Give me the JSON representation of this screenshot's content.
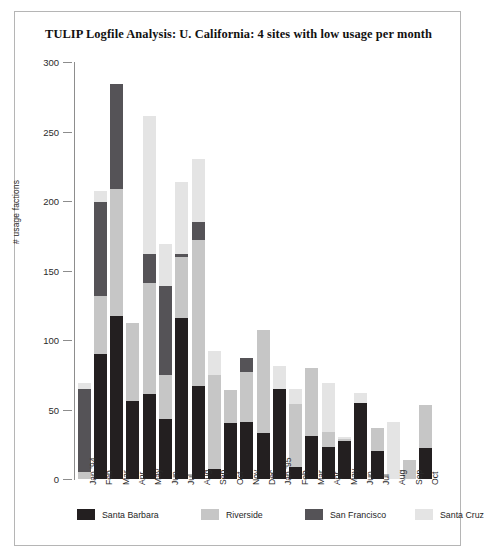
{
  "chart_data": {
    "type": "bar",
    "stacked": true,
    "title": "TULIP Logfile Analysis: U. California: 4 sites with low usage per month",
    "xlabel": "",
    "ylabel": "# usage factions",
    "ylim": [
      0,
      300
    ],
    "yticks": [
      0,
      50,
      100,
      150,
      200,
      250,
      300
    ],
    "grid": false,
    "legend_position": "bottom",
    "categories": [
      "Jan '94",
      "Feb",
      "Mar",
      "Apr",
      "May",
      "Jun",
      "Jul",
      "Aug",
      "Sep",
      "Oct",
      "Nov",
      "Dec",
      "Jan '95",
      "Feb",
      "Mar",
      "Apr",
      "May",
      "Jun",
      "Jul",
      "Aug",
      "Sep",
      "Oct"
    ],
    "series": [
      {
        "name": "Santa Barbara",
        "color": "#231f20",
        "values": [
          0,
          90,
          117,
          56,
          61,
          43,
          116,
          67,
          7,
          40,
          41,
          33,
          65,
          9,
          31,
          23,
          27,
          55,
          20,
          0,
          0,
          22
        ]
      },
      {
        "name": "Riverside",
        "color": "#c6c6c6",
        "values": [
          5,
          42,
          92,
          56,
          80,
          32,
          44,
          105,
          68,
          24,
          36,
          74,
          0,
          45,
          49,
          11,
          2,
          0,
          17,
          0,
          14,
          31
        ]
      },
      {
        "name": "San Francisco",
        "color": "#555357",
        "values": [
          60,
          67,
          75,
          0,
          21,
          64,
          2,
          13,
          0,
          0,
          10,
          0,
          0,
          0,
          0,
          0,
          0,
          0,
          0,
          0,
          0,
          0
        ]
      },
      {
        "name": "Santa Cruz",
        "color": "#e4e4e4",
        "values": [
          4,
          8,
          0,
          0,
          99,
          30,
          52,
          45,
          17,
          0,
          0,
          0,
          16,
          11,
          0,
          35,
          1,
          7,
          0,
          41,
          0,
          0
        ]
      }
    ],
    "totals": [
      69,
      207,
      284,
      112,
      261,
      169,
      214,
      230,
      92,
      64,
      87,
      107,
      81,
      65,
      80,
      69,
      30,
      62,
      37,
      41,
      14,
      53
    ]
  },
  "legend": {
    "items": [
      {
        "label": "Santa Barbara",
        "color": "#231f20"
      },
      {
        "label": "Riverside",
        "color": "#c6c6c6"
      },
      {
        "label": "San Francisco",
        "color": "#555357"
      },
      {
        "label": "Santa Cruz",
        "color": "#e4e4e4"
      }
    ]
  }
}
